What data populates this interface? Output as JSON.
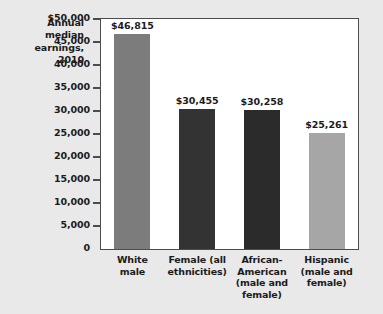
{
  "chart_data": {
    "type": "bar",
    "title_lines": [
      "Annual",
      "median",
      "earnings,",
      "2010"
    ],
    "xlabel": "",
    "ylabel": "Annual median earnings, 2010",
    "ylim": [
      0,
      50000
    ],
    "ytick_step": 5000,
    "grid": false,
    "legend": "none",
    "categories": [
      "White male",
      "Female (all ethnicities)",
      "African-American (male and female)",
      "Hispanic (male and female)"
    ],
    "category_lines": [
      [
        "White",
        "male"
      ],
      [
        "Female (all",
        "ethnicities)"
      ],
      [
        "African-",
        "American",
        "(male and",
        "female)"
      ],
      [
        "Hispanic",
        "(male and",
        "female)"
      ]
    ],
    "values": [
      46815,
      30455,
      30258,
      25261
    ],
    "value_labels": [
      "$46,815",
      "$30,455",
      "$30,258",
      "$25,261"
    ],
    "bar_colors": [
      "#7c7c7c",
      "#333333",
      "#2b2b2b",
      "#a6a6a6"
    ],
    "ytick_labels": [
      "$50,000",
      "45,000",
      "40,000",
      "35,000",
      "30,000",
      "25,000",
      "20,000",
      "15,000",
      "10,000",
      "5,000",
      "0"
    ],
    "ytick_values": [
      50000,
      45000,
      40000,
      35000,
      30000,
      25000,
      20000,
      15000,
      10000,
      5000,
      0
    ]
  },
  "figure": {
    "background_color": "#e9e9e9",
    "plot_background_color": "#ffffff",
    "axis_color": "#4c4c4c",
    "text_color": "#1b1b1b"
  }
}
